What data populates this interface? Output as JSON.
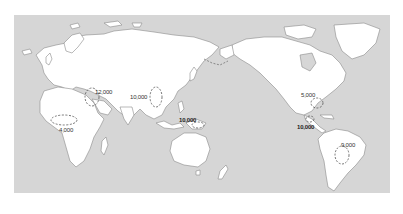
{
  "map": {
    "projection": "Pacific-centered world map",
    "colors": {
      "ocean": "#d6d6d6",
      "land": "#ffffff",
      "coastline": "#8a8a8a",
      "region_outline": "#555555",
      "label": "#333333"
    },
    "regions": [
      {
        "id": "fertile-crescent",
        "label": "12,000"
      },
      {
        "id": "china",
        "label": "10,000"
      },
      {
        "id": "sub-saharan-africa",
        "label": "4,000"
      },
      {
        "id": "new-guinea",
        "label": "10,000"
      },
      {
        "id": "eastern-north-america",
        "label": "5,000"
      },
      {
        "id": "mesoamerica",
        "label": "10,000"
      },
      {
        "id": "south-america",
        "label": "9,000"
      }
    ]
  }
}
